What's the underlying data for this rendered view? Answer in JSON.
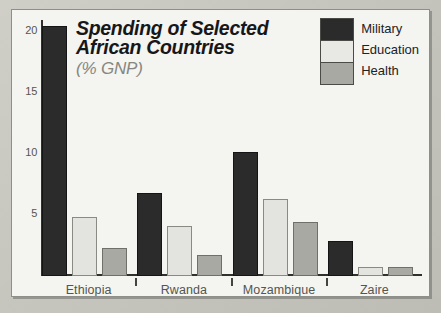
{
  "chart_data": {
    "type": "bar",
    "title": "Spending of Selected African Countries",
    "title_line1": "Spending of Selected",
    "title_line2": "African Countries",
    "subtitle": "(% GNP)",
    "xlabel": "",
    "ylabel": "",
    "ylim": [
      0,
      21
    ],
    "grid": false,
    "legend_position": "top-right",
    "yticks": [
      20,
      15,
      10,
      5
    ],
    "ytick_labels": [
      "20",
      "15",
      "10",
      "5"
    ],
    "categories": [
      "Ethiopia",
      "Rwanda",
      "Mozambique",
      "Zaire"
    ],
    "series": [
      {
        "name": "Military",
        "color": "#2b2b2b",
        "values": [
          20.5,
          6.85,
          10.2,
          2.9
        ]
      },
      {
        "name": "Education",
        "color": "#e3e3df",
        "values": [
          4.85,
          4.1,
          6.3,
          0.7
        ]
      },
      {
        "name": "Health",
        "color": "#a9a9a4",
        "values": [
          2.3,
          1.75,
          4.4,
          0.7
        ]
      }
    ]
  },
  "colors": {
    "military": "#2b2b2b",
    "education": "#e3e3df",
    "health": "#a9a9a4",
    "panel_background": "#f2f2ee",
    "frame_background": "#c6c6bf",
    "axis": "#30302e",
    "tick_text": "#55554f",
    "title_text": "#17171a",
    "subtitle_text": "#86867f"
  }
}
